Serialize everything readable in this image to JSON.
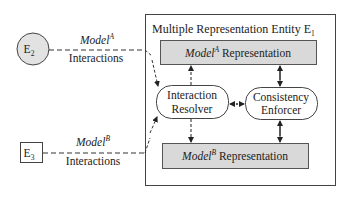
{
  "diagram": {
    "entity_e1": {
      "title": "Multiple Representation Entity E",
      "title_sub": "1"
    },
    "entity_e2": {
      "label": "E",
      "sub": "2",
      "shape": "circle"
    },
    "entity_e3": {
      "label": "E",
      "sub": "3",
      "shape": "box"
    },
    "interactions_a": {
      "model": "Model",
      "sup": "A",
      "label": "Interactions"
    },
    "interactions_b": {
      "model": "Model",
      "sup": "B",
      "label": "Interactions"
    },
    "representation_a": {
      "model": "Model",
      "sup": "A",
      "label": " Representation"
    },
    "representation_b": {
      "model": "Model",
      "sup": "B",
      "label": " Representation"
    },
    "interaction_resolver": {
      "line1": "Interaction",
      "line2": "Resolver"
    },
    "consistency_enforcer": {
      "line1": "Consistency",
      "line2": "Enforcer"
    },
    "colors": {
      "stroke": "#333333",
      "box_fill": "#d9d9d9",
      "circle_fill": "#e2e2e2",
      "background": "#ffffff"
    }
  }
}
